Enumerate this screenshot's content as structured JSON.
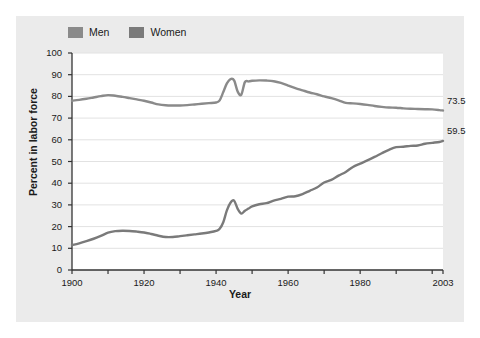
{
  "figure": {
    "background_color": "#ebebeb",
    "plot_background_color": "#ffffff"
  },
  "legend": {
    "position": "top-left",
    "entries": [
      {
        "label": "Men",
        "color": "#8a8a8a",
        "swatch_name": "legend-swatch-men"
      },
      {
        "label": "Women",
        "color": "#7a7a7a",
        "swatch_name": "legend-swatch-women"
      }
    ]
  },
  "axes": {
    "xlabel": "Year",
    "ylabel": "Percent in labor force",
    "xticks": [
      "1900",
      "1920",
      "1940",
      "1960",
      "1980",
      "2003"
    ],
    "yticks": [
      "0",
      "10",
      "20",
      "30",
      "40",
      "50",
      "60",
      "70",
      "80",
      "90",
      "100"
    ]
  },
  "endpoint_labels": {
    "men": "73.5",
    "women": "59.5"
  },
  "chart_data": {
    "type": "line",
    "title": "",
    "xlabel": "Year",
    "ylabel": "Percent in labor force",
    "xlim": [
      1900,
      2003
    ],
    "ylim": [
      0,
      100
    ],
    "xticks": [
      1900,
      1920,
      1940,
      1960,
      1980,
      2003
    ],
    "yticks": [
      0,
      10,
      20,
      30,
      40,
      50,
      60,
      70,
      80,
      90,
      100
    ],
    "grid": "horizontal",
    "legend_position": "top-left",
    "annotations": [
      {
        "text": "73.5",
        "series": "Men",
        "x": 2003,
        "y": 73.5
      },
      {
        "text": "59.5",
        "series": "Women",
        "x": 2003,
        "y": 59.5
      }
    ],
    "x": [
      1900,
      1902,
      1904,
      1906,
      1908,
      1910,
      1912,
      1914,
      1916,
      1918,
      1920,
      1922,
      1924,
      1926,
      1928,
      1930,
      1932,
      1934,
      1936,
      1938,
      1940,
      1941,
      1942,
      1943,
      1944,
      1945,
      1946,
      1947,
      1948,
      1949,
      1950,
      1952,
      1954,
      1956,
      1958,
      1960,
      1962,
      1964,
      1966,
      1968,
      1970,
      1972,
      1974,
      1976,
      1978,
      1980,
      1982,
      1984,
      1986,
      1988,
      1990,
      1992,
      1994,
      1996,
      1998,
      2000,
      2002,
      2003
    ],
    "series": [
      {
        "name": "Men",
        "color": "#8a8a8a",
        "values": [
          78.0,
          78.4,
          78.9,
          79.5,
          80.1,
          80.6,
          80.3,
          79.8,
          79.2,
          78.6,
          78.0,
          77.2,
          76.3,
          75.9,
          75.8,
          75.8,
          76.0,
          76.3,
          76.6,
          76.9,
          77.2,
          78.2,
          82.0,
          86.0,
          88.0,
          87.4,
          82.2,
          80.8,
          86.6,
          86.9,
          87.2,
          87.4,
          87.3,
          87.0,
          86.2,
          85.0,
          83.8,
          82.8,
          81.8,
          81.0,
          80.0,
          79.2,
          78.2,
          77.0,
          76.8,
          76.5,
          76.1,
          75.6,
          75.2,
          74.9,
          74.8,
          74.5,
          74.3,
          74.2,
          74.1,
          74.0,
          73.7,
          73.5
        ]
      },
      {
        "name": "Women",
        "color": "#7a7a7a",
        "values": [
          11.5,
          12.3,
          13.3,
          14.4,
          15.7,
          17.2,
          17.9,
          18.1,
          18.0,
          17.7,
          17.3,
          16.6,
          15.8,
          15.2,
          15.2,
          15.6,
          16.0,
          16.4,
          16.8,
          17.3,
          18.0,
          19.0,
          22.0,
          27.5,
          31.0,
          32.0,
          28.2,
          26.0,
          27.3,
          28.3,
          29.3,
          30.3,
          30.8,
          32.0,
          32.8,
          33.8,
          34.0,
          35.0,
          36.5,
          38.0,
          40.3,
          41.5,
          43.5,
          45.2,
          47.5,
          49.0,
          50.5,
          52.1,
          53.8,
          55.4,
          56.6,
          56.8,
          57.2,
          57.4,
          58.2,
          58.6,
          59.0,
          59.5
        ]
      }
    ]
  }
}
